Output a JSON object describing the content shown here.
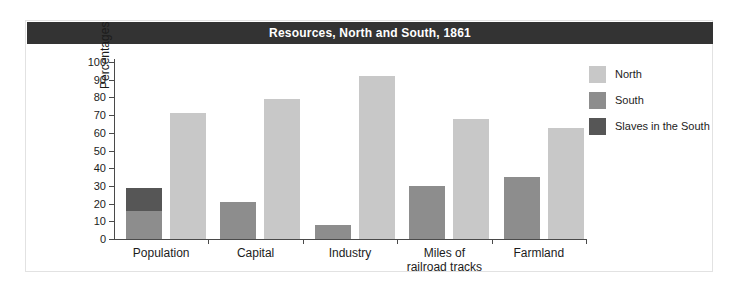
{
  "figure": {
    "title": "Resources, North and South, 1861"
  },
  "colors": {
    "north": "#c8c8c8",
    "south": "#8d8d8d",
    "slaves": "#565656",
    "title_bar_bg": "#333333",
    "title_bar_text": "#ffffff",
    "axis": "#4a4a4a",
    "frame_border": "#e2e2e2",
    "background": "#ffffff"
  },
  "chart_data": {
    "type": "bar",
    "title": "Resources, North and South, 1861",
    "xlabel": "",
    "ylabel": "Percentages",
    "ylim": [
      0,
      100
    ],
    "yticks": [
      0,
      10,
      20,
      30,
      40,
      50,
      60,
      70,
      80,
      90,
      100
    ],
    "grid": false,
    "stacked_south": true,
    "legend_position": "right",
    "categories": [
      "Population",
      "Capital",
      "Industry",
      "Miles of railroad tracks",
      "Farmland"
    ],
    "category_lines": [
      [
        "Population"
      ],
      [
        "Capital"
      ],
      [
        "Industry"
      ],
      [
        "Miles of",
        "railroad tracks"
      ],
      [
        "Farmland"
      ]
    ],
    "series": [
      {
        "name": "North",
        "color": "#c8c8c8",
        "values": [
          71,
          79,
          92,
          68,
          63
        ]
      },
      {
        "name": "South",
        "color": "#8d8d8d",
        "values": [
          16,
          21,
          8,
          30,
          35
        ]
      },
      {
        "name": "Slaves in the South",
        "color": "#565656",
        "values": [
          13,
          0,
          0,
          0,
          0
        ]
      }
    ],
    "south_totals": [
      29,
      21,
      8,
      30,
      35
    ]
  },
  "legend": {
    "items": [
      {
        "label": "North",
        "color": "#c8c8c8"
      },
      {
        "label": "South",
        "color": "#8d8d8d"
      },
      {
        "label": "Slaves in the South",
        "color": "#565656"
      }
    ]
  }
}
